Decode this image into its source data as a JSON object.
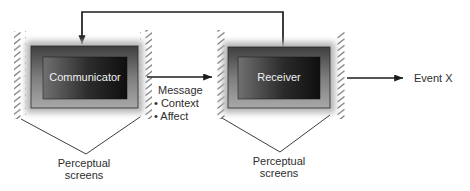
{
  "colors": {
    "background": "#ffffff",
    "line": "#1c1c1c",
    "pointer_line": "#3e3e3e",
    "hatch": "#6e6e6e",
    "label_text": "#2e2e2e",
    "box_label_text": "#f0f0f0",
    "frame_top": "#3f3f3f",
    "frame_mid": "#7d7d7d",
    "frame_bottom": "#a8a8a8",
    "screen_left": "#707070",
    "screen_mid": "#2b2b2b",
    "screen_right": "#0f0f0f",
    "glow": "#b4b4b4"
  },
  "boxes": {
    "communicator_label": "Communicator",
    "receiver_label": "Receiver"
  },
  "message": {
    "title": "Message",
    "context_item": "• Context",
    "affect_item": "• Affect"
  },
  "event_label": "Event X",
  "perceptual_left": {
    "line1": "Perceptual",
    "line2": "screens"
  },
  "perceptual_right": {
    "line1": "Perceptual",
    "line2": "screens"
  }
}
